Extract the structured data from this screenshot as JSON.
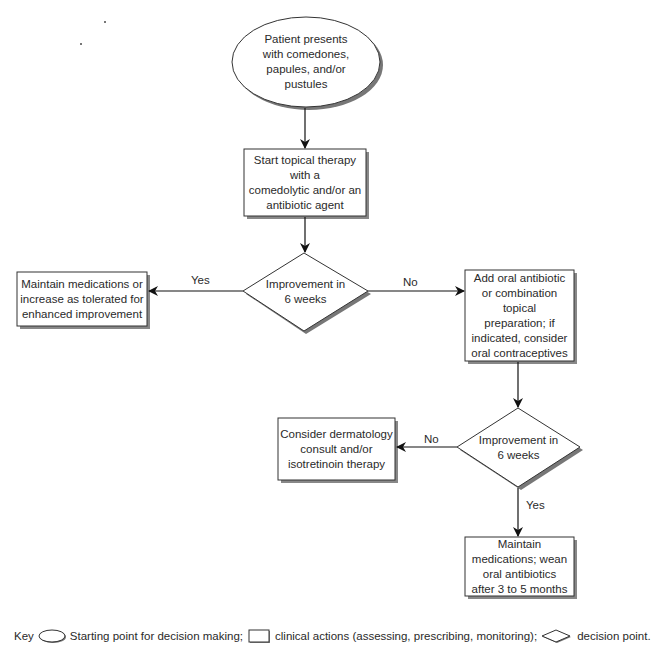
{
  "diagram": {
    "type": "flowchart",
    "nodes": {
      "start": {
        "shape": "oval",
        "text": "Patient presents\nwith comedones,\npapules, and/or\npustules"
      },
      "topical": {
        "shape": "rect",
        "text": "Start topical therapy\nwith a\ncomedolytic and/or an\nantibiotic agent"
      },
      "decision1": {
        "shape": "diamond",
        "text": "Improvement in\n6 weeks"
      },
      "maintain1": {
        "shape": "rect",
        "text": "Maintain medications or\nincrease as tolerated for\nenhanced improvement"
      },
      "oral": {
        "shape": "rect",
        "text": "Add oral antibiotic\nor combination\ntopical\npreparation; if\nindicated, consider\noral contraceptives"
      },
      "decision2": {
        "shape": "diamond",
        "text": "Improvement in\n6 weeks"
      },
      "derm": {
        "shape": "rect",
        "text": "Consider dermatology\nconsult and/or\nisotretinoin therapy"
      },
      "maintain2": {
        "shape": "rect",
        "text": "Maintain\nmedications; wean\noral antibiotics\nafter 3 to 5 months"
      }
    },
    "edges": [
      {
        "from": "start",
        "to": "topical",
        "label": ""
      },
      {
        "from": "topical",
        "to": "decision1",
        "label": ""
      },
      {
        "from": "decision1",
        "to": "maintain1",
        "label": "Yes"
      },
      {
        "from": "decision1",
        "to": "oral",
        "label": "No"
      },
      {
        "from": "oral",
        "to": "decision2",
        "label": ""
      },
      {
        "from": "decision2",
        "to": "derm",
        "label": "No"
      },
      {
        "from": "decision2",
        "to": "maintain2",
        "label": "Yes"
      }
    ],
    "edge_labels": {
      "d1_yes": "Yes",
      "d1_no": "No",
      "d2_no": "No",
      "d2_yes": "Yes"
    }
  },
  "key": {
    "prefix": "Key",
    "oval_desc": "Starting point for decision making;",
    "rect_desc": "clinical actions (assessing, prescribing, monitoring);",
    "diamond_desc": "decision point."
  }
}
